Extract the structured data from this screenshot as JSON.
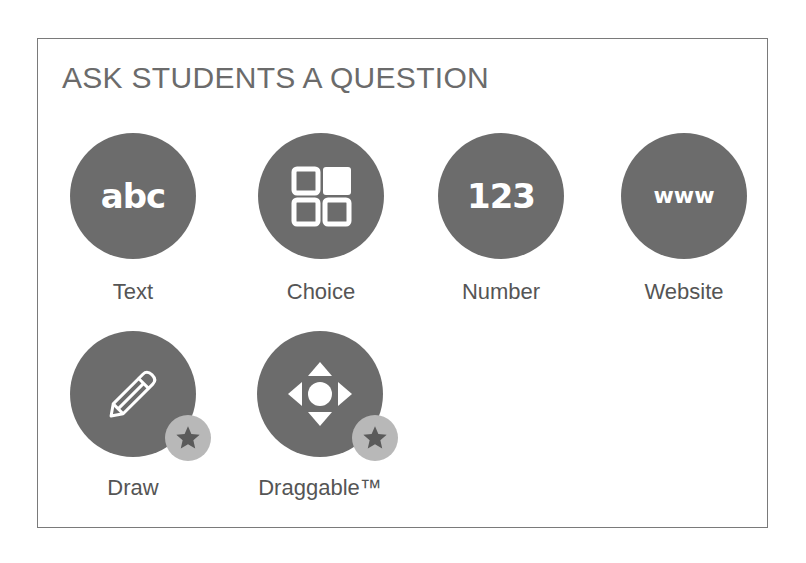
{
  "panel": {
    "title": "ASK STUDENTS A QUESTION"
  },
  "question_types": [
    {
      "id": "text",
      "label": "Text",
      "icon": "abc-icon",
      "glyph": "abc",
      "premium": false
    },
    {
      "id": "choice",
      "label": "Choice",
      "icon": "choice-grid-icon",
      "premium": false
    },
    {
      "id": "number",
      "label": "Number",
      "icon": "number-icon",
      "glyph": "123",
      "premium": false
    },
    {
      "id": "website",
      "label": "Website",
      "icon": "www-icon",
      "glyph": "www",
      "premium": false
    },
    {
      "id": "draw",
      "label": "Draw",
      "icon": "pencil-icon",
      "premium": true,
      "badge_icon": "star-icon"
    },
    {
      "id": "draggable",
      "label": "Draggable™",
      "icon": "move-arrows-icon",
      "premium": true,
      "badge_icon": "star-icon"
    }
  ],
  "colors": {
    "circle_fill": "#6c6c6c",
    "icon_glyph": "#ffffff",
    "label_text": "#555555",
    "title_text": "#6b6b6b",
    "badge_fill": "#b8b8b8",
    "badge_star": "#5a5a5a",
    "panel_border": "#7a7a7a"
  }
}
